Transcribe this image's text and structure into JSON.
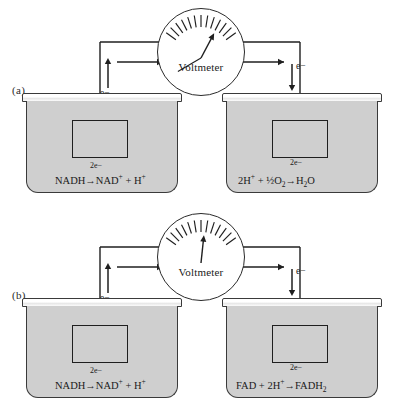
{
  "figure": {
    "type": "diagram",
    "background_color": "#ffffff",
    "solution_color": "#cfcfcf",
    "line_color": "#1f1f1f"
  },
  "panels": [
    {
      "id": "a",
      "label": "(a)",
      "voltmeter": {
        "label": "Voltmeter",
        "needle_angle_deg": 28,
        "tick_count": 13,
        "icon": "voltmeter-gauge-icon"
      },
      "left_cell": {
        "name": "nadh-half-cell",
        "electron_label": "e−",
        "electron_flow": "up",
        "electrode_label": "electrode",
        "electron_count_label": "2e−",
        "reaction": {
          "reactants": "NADH",
          "arrow": "→",
          "products_1": "NAD",
          "products_1_sup": "+",
          "plus": " + ",
          "products_2": "H",
          "products_2_sup": "+"
        }
      },
      "right_cell": {
        "name": "oxygen-half-cell",
        "electron_label": "e−",
        "electron_flow": "down",
        "electrode_label": "electrode",
        "electron_count_label": "2e−",
        "reaction": {
          "reactant_1": "2H",
          "reactant_1_sup": "+",
          "plus": " + ",
          "reactant_2": "½O",
          "reactant_2_sub": "2",
          "arrow": "→",
          "product": "H",
          "product_sub": "2",
          "product_tail": "O"
        }
      }
    },
    {
      "id": "b",
      "label": "(b)",
      "voltmeter": {
        "label": "Voltmeter",
        "needle_angle_deg": 6,
        "tick_count": 13,
        "icon": "voltmeter-gauge-icon"
      },
      "left_cell": {
        "name": "nadh-half-cell",
        "electron_label": "e−",
        "electron_flow": "up",
        "electrode_label": "electrode",
        "electron_count_label": "2e−",
        "reaction": {
          "reactants": "NADH",
          "arrow": "→",
          "products_1": "NAD",
          "products_1_sup": "+",
          "plus": " + ",
          "products_2": "H",
          "products_2_sup": "+"
        }
      },
      "right_cell": {
        "name": "fad-half-cell",
        "electron_label": "e−",
        "electron_flow": "down",
        "electrode_label": "electrode",
        "electron_count_label": "2e−",
        "reaction": {
          "reactant_1": "FAD",
          "plus": " + ",
          "reactant_2": "2H",
          "reactant_2_sup": "+",
          "arrow": "→",
          "product": "FADH",
          "product_sub": "2"
        }
      }
    }
  ]
}
